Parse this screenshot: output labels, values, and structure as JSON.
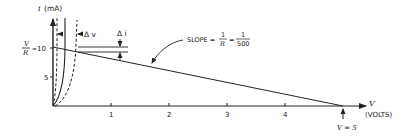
{
  "diagram": {
    "type": "diode-load-line",
    "y_axis": {
      "symbol": "i",
      "unit": "(mA)",
      "ticks": [
        {
          "label": "5",
          "value": 5
        },
        {
          "label": "10",
          "value": 10
        }
      ],
      "intercept_label_num": "V",
      "intercept_label_den": "R",
      "intercept_eq": "= 10"
    },
    "x_axis": {
      "symbol": "V",
      "unit": "(VOLTS)",
      "ticks": [
        {
          "label": "1",
          "value": 1
        },
        {
          "label": "2",
          "value": 2
        },
        {
          "label": "3",
          "value": 3
        },
        {
          "label": "4",
          "value": 4
        }
      ],
      "intercept_label": "V = 5"
    },
    "annotations": {
      "delta_v": "Δ v",
      "delta_i": "Δ i",
      "slope_prefix": "SLOPE =",
      "slope_frac1_num": "1",
      "slope_frac1_den": "R",
      "slope_eq": "=",
      "slope_frac2_num": "1",
      "slope_frac2_den": "500"
    },
    "load_line": {
      "from": [
        0,
        10
      ],
      "to": [
        5,
        0
      ]
    },
    "curves": [
      {
        "name": "diode-curve-left",
        "style": "dashed"
      },
      {
        "name": "diode-curve-nominal",
        "style": "solid"
      },
      {
        "name": "diode-curve-right",
        "style": "dashed"
      }
    ],
    "colors": {
      "ink": "#222222",
      "background": "#ffffff"
    }
  }
}
